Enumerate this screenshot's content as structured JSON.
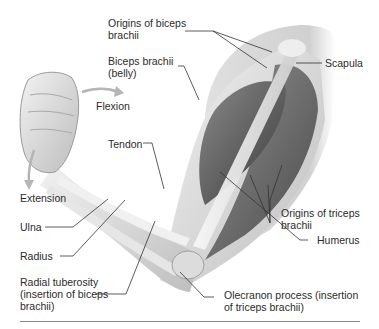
{
  "figure": {
    "movements": [
      {
        "id": "flexion",
        "label": "Flexion"
      },
      {
        "id": "extension",
        "label": "Extension"
      }
    ],
    "labels": {
      "origins_biceps": [
        "Origins of biceps",
        "brachii"
      ],
      "biceps_belly": [
        "Biceps brachii",
        "(belly)"
      ],
      "scapula": [
        "Scapula"
      ],
      "tendon": [
        "Tendon"
      ],
      "origins_triceps": [
        "Origins of triceps",
        "brachii"
      ],
      "humerus": [
        "Humerus"
      ],
      "ulna": [
        "Ulna"
      ],
      "radius": [
        "Radius"
      ],
      "radial_tuberosity": [
        "Radial tuberosity",
        "(insertion of biceps",
        "brachii)"
      ],
      "olecranon": [
        "Olecranon process (insertion",
        "of triceps brachii)"
      ]
    },
    "colors": {
      "text": "#2b2b2b",
      "leader": "#333333",
      "arrow": "#b5b5b5",
      "muscle_dark": "#4a4a4a",
      "skin": "#d9d9d9"
    }
  }
}
